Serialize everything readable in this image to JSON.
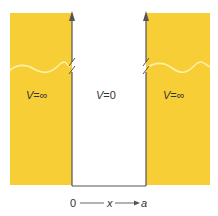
{
  "figure": {
    "colors": {
      "barrier_fill": "#F7CE36",
      "wave_line": "#FDF0A8",
      "wall_line": "#555555",
      "text": "#333333",
      "background": "#FFFFFF"
    },
    "regions": {
      "left": {
        "symbol": "V",
        "equals": "=",
        "value": "∞"
      },
      "middle": {
        "symbol": "V",
        "equals": "=",
        "value": "0"
      },
      "right": {
        "symbol": "V",
        "equals": "=",
        "value": "∞"
      }
    },
    "axis": {
      "start_label": "0",
      "variable_label": "x",
      "end_label": "a"
    }
  }
}
